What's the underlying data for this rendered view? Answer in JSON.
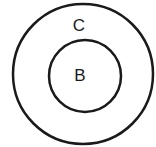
{
  "diagram": {
    "type": "venn-nested-sets",
    "outer_set": {
      "label": "C",
      "stroke": "#1a1a1a"
    },
    "inner_set": {
      "label": "B",
      "stroke": "#1a1a1a"
    },
    "relationship": "B is a subset of C"
  }
}
